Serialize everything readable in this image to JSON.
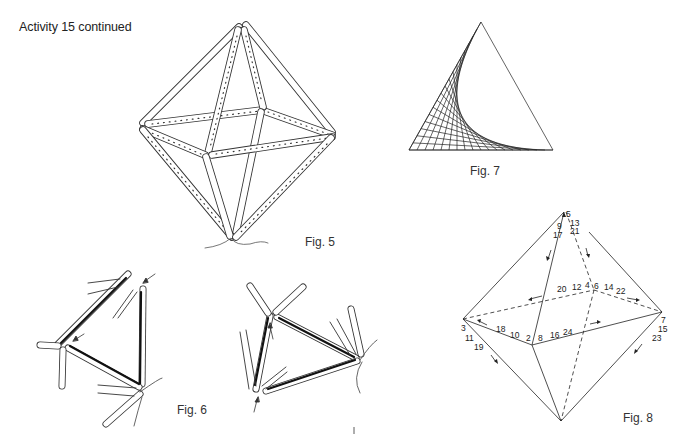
{
  "page": {
    "heading": "Activity 15 continued"
  },
  "figures": [
    {
      "id": "fig5",
      "caption": "Fig. 5",
      "description": "Octahedron skeleton built from perforated straws, with thread tail at bottom vertex"
    },
    {
      "id": "fig6",
      "caption": "Fig. 6",
      "description": "Two views of triangles of straws being joined, arrows indicating joints"
    },
    {
      "id": "fig7",
      "caption": "Fig. 7",
      "description": "Triangle with string-art envelope curve in lower-left corner"
    },
    {
      "id": "fig8",
      "caption": "Fig. 8",
      "description": "Octahedron threading order diagram with numbered edges and direction arrows"
    }
  ],
  "fig8_labels": {
    "top_vertex": [
      "1",
      "9",
      "17"
    ],
    "top_back": [
      "5",
      "13",
      "21"
    ],
    "back_left": [
      "20",
      "12",
      "4"
    ],
    "back_right": [
      "6",
      "14",
      "22"
    ],
    "left_vertex": [
      "3",
      "11",
      "19"
    ],
    "front_left": [
      "18",
      "10",
      "2"
    ],
    "front_right": [
      "8",
      "16",
      "24"
    ],
    "right_vertex": [
      "7",
      "15",
      "23"
    ]
  }
}
